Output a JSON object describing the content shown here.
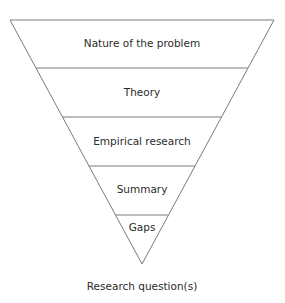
{
  "diagram": {
    "type": "inverted-pyramid",
    "layers": [
      {
        "label": "Nature of the problem"
      },
      {
        "label": "Theory"
      },
      {
        "label": "Empirical research"
      },
      {
        "label": "Summary"
      },
      {
        "label": "Gaps"
      }
    ],
    "output_label": "Research question(s)",
    "colors": {
      "line": "#7a7a7a",
      "text": "#2b2b2b",
      "background": "#ffffff"
    }
  }
}
